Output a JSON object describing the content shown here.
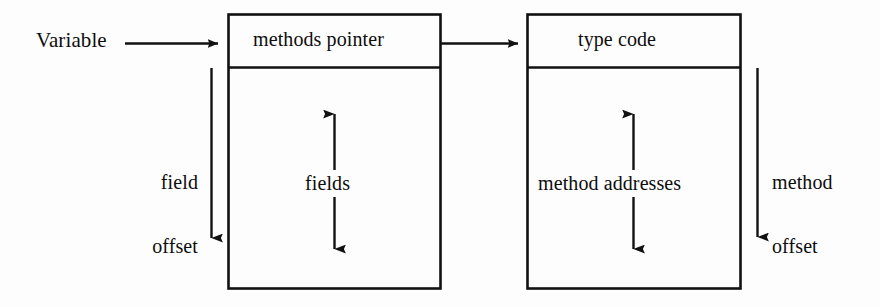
{
  "diagram": {
    "background_color": "#fdfdfd",
    "stroke_color": "#111111",
    "text_color": "#0d0d0d"
  },
  "labels": {
    "variable": "Variable",
    "methods_pointer": "methods pointer",
    "type_code": "type code",
    "fields": "fields",
    "method_addresses": "method addresses",
    "field_offset_line1": "field",
    "field_offset_line2": "offset",
    "method_offset_line1": "method",
    "method_offset_line2": "offset"
  },
  "boxes": [
    {
      "name": "object-box",
      "header": "methods pointer",
      "body": "fields",
      "x": 228,
      "y": 14,
      "width": 213,
      "height": 275,
      "header_height": 53
    },
    {
      "name": "methods-table-box",
      "header": "type code",
      "body": "method addresses",
      "x": 527,
      "y": 14,
      "width": 214,
      "height": 275,
      "header_height": 53
    }
  ],
  "arrows": [
    {
      "name": "variable-to-object-arrow",
      "direction": "right",
      "from_x": 125,
      "from_y": 43,
      "to_x": 226,
      "to_y": 43
    },
    {
      "name": "methods-pointer-to-type-code-arrow",
      "direction": "right",
      "from_x": 441,
      "from_y": 43,
      "to_x": 525,
      "to_y": 43
    },
    {
      "name": "field-offset-arrow",
      "direction": "down",
      "from_x": 211,
      "from_y": 68,
      "to_x": 211,
      "to_y": 248
    },
    {
      "name": "method-offset-arrow",
      "direction": "down",
      "from_x": 757,
      "from_y": 68,
      "to_x": 757,
      "to_y": 247
    },
    {
      "name": "fields-up-arrow",
      "direction": "up",
      "from_x": 334,
      "from_y": 170,
      "to_x": 334,
      "to_y": 104
    },
    {
      "name": "fields-down-arrow",
      "direction": "down",
      "from_x": 334,
      "from_y": 197,
      "to_x": 334,
      "to_y": 259
    },
    {
      "name": "method-addresses-up-arrow",
      "direction": "up",
      "from_x": 633,
      "from_y": 170,
      "to_x": 633,
      "to_y": 104
    },
    {
      "name": "method-addresses-down-arrow",
      "direction": "down",
      "from_x": 633,
      "from_y": 197,
      "to_x": 633,
      "to_y": 259
    }
  ]
}
